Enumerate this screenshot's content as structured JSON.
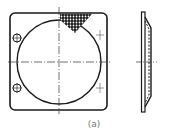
{
  "figure": {
    "caption": "(a)",
    "line_color": "#1a1a1a",
    "front_view": {
      "plate": {
        "x": 10,
        "y": 13,
        "w": 97,
        "h": 97,
        "corner_radius": 5
      },
      "circle": {
        "cx": 59,
        "cy": 62,
        "r": 42
      },
      "holes": [
        {
          "cx": 17,
          "cy": 38,
          "r": 4
        },
        {
          "cx": 17,
          "cy": 88,
          "r": 4
        }
      ],
      "tick_marks": [
        {
          "x": 100,
          "y": 35
        },
        {
          "x": 100,
          "y": 88
        }
      ],
      "hatch_region": "mesh-triangle-top-right"
    },
    "side_view": {
      "flange_x": 143,
      "flange_top": 12,
      "flange_bottom": 112,
      "bulge_x": 152,
      "bulge_top": 28,
      "bulge_bottom": 96
    }
  }
}
